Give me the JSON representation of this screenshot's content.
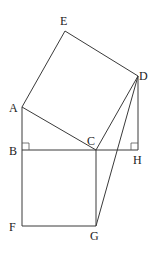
{
  "diagram": {
    "type": "geometry",
    "points": {
      "A": {
        "x": 22,
        "y": 107
      },
      "B": {
        "x": 22,
        "y": 150
      },
      "C": {
        "x": 96,
        "y": 150
      },
      "D": {
        "x": 138,
        "y": 76
      },
      "E": {
        "x": 65,
        "y": 31
      },
      "H": {
        "x": 138,
        "y": 150
      },
      "F": {
        "x": 22,
        "y": 226
      },
      "G": {
        "x": 96,
        "y": 226
      }
    },
    "labels": {
      "A": "A",
      "B": "B",
      "C": "C",
      "D": "D",
      "E": "E",
      "F": "F",
      "G": "G",
      "H": "H"
    },
    "segments": [
      [
        "A",
        "E"
      ],
      [
        "E",
        "D"
      ],
      [
        "D",
        "C"
      ],
      [
        "C",
        "A"
      ],
      [
        "A",
        "B"
      ],
      [
        "B",
        "C"
      ],
      [
        "C",
        "H"
      ],
      [
        "D",
        "H"
      ],
      [
        "B",
        "F"
      ],
      [
        "F",
        "G"
      ],
      [
        "G",
        "C"
      ],
      [
        "D",
        "G"
      ]
    ],
    "right_angles": [
      "B",
      "H"
    ],
    "shapes": {
      "square_ACDE": [
        "A",
        "C",
        "D",
        "E"
      ],
      "square_BCGF": [
        "B",
        "C",
        "G",
        "F"
      ],
      "triangle_ABC": [
        "A",
        "B",
        "C"
      ],
      "triangle_DCH": [
        "D",
        "C",
        "H"
      ]
    }
  }
}
